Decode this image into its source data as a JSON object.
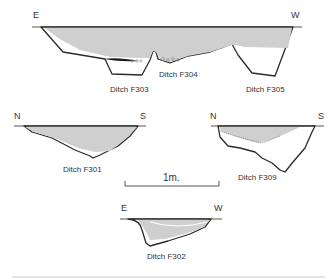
{
  "figure": {
    "type": "archaeological section drawings",
    "colors": {
      "fill": "#cfcfcf",
      "outline": "#2a2a2a",
      "ground_line": "#555555",
      "text": "#333333"
    }
  },
  "sections": [
    {
      "id": "top",
      "left_orientation": "E",
      "right_orientation": "W",
      "labels": [
        "Ditch F303",
        "Ditch F304",
        "Ditch F305"
      ]
    },
    {
      "id": "f301",
      "left_orientation": "N",
      "right_orientation": "S",
      "label": "Ditch F301"
    },
    {
      "id": "f309",
      "left_orientation": "N",
      "right_orientation": "S",
      "label": "Ditch F309"
    },
    {
      "id": "f302",
      "left_orientation": "E",
      "right_orientation": "W",
      "label": "Ditch F302"
    }
  ],
  "scale_bar": {
    "label": "1m."
  }
}
